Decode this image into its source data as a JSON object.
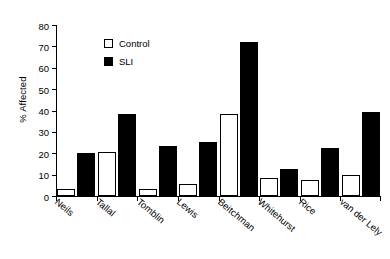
{
  "chart_data": {
    "type": "bar",
    "title": "",
    "subtitle": "",
    "xlabel": "",
    "ylabel": "% Affected",
    "ylim": [
      0,
      80
    ],
    "ytick_values": [
      0,
      10,
      20,
      30,
      40,
      50,
      60,
      70,
      80
    ],
    "ytick_labels": [
      "0",
      "10",
      "20",
      "30",
      "40",
      "50",
      "60",
      "70",
      "80"
    ],
    "grid": false,
    "legend_position": "upper-left-inside",
    "categories": [
      "Neils",
      "Tallal",
      "Tomblin",
      "Lewis",
      "Beitchman",
      "Whitehurst",
      "Rice",
      "van der Lely"
    ],
    "series": [
      {
        "name": "Control",
        "style": "open",
        "fill_color": "#ffffff",
        "edge_color": "#000000",
        "values": [
          3.2,
          20.4,
          3.2,
          5.6,
          38.6,
          8.4,
          7.7,
          9.6
        ]
      },
      {
        "name": "SLI",
        "style": "filled",
        "fill_color": "#000000",
        "edge_color": "#000000",
        "values": [
          20.1,
          38.2,
          23.3,
          25.2,
          71.9,
          12.6,
          22.3,
          39.1
        ]
      }
    ],
    "annotations": []
  },
  "legend": {
    "items": [
      {
        "label": "Control",
        "swatch": "open-square-marker"
      },
      {
        "label": "SLI",
        "swatch": "filled-square-marker"
      }
    ]
  },
  "axes": {
    "y_title": "% Affected",
    "axis_color": "#000000",
    "background": "#ffffff"
  }
}
